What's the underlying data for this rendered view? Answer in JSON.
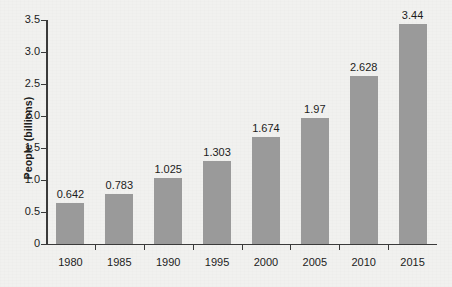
{
  "chart_data": {
    "type": "bar",
    "title": "",
    "xlabel": "",
    "ylabel": "People (billions)",
    "categories": [
      "1980",
      "1985",
      "1990",
      "1995",
      "2000",
      "2005",
      "2010",
      "2015"
    ],
    "values": [
      0.642,
      0.783,
      1.025,
      1.303,
      1.674,
      1.97,
      2.628,
      3.44
    ],
    "value_labels": [
      "0.642",
      "0.783",
      "1.025",
      "1.303",
      "1.674",
      "1.97",
      "2.628",
      "3.44"
    ],
    "ylim": [
      0,
      3.5
    ],
    "yticks": [
      0,
      0.5,
      1.0,
      1.5,
      2.0,
      2.5,
      3.0,
      3.5
    ],
    "ytick_labels": [
      "0",
      "0.5",
      "1.0",
      "1.5",
      "2.0",
      "2.5",
      "3.0",
      "3.5"
    ],
    "grid": false,
    "legend": null,
    "series": [
      {
        "name": "People (billions)",
        "values": [
          0.642,
          0.783,
          1.025,
          1.303,
          1.674,
          1.97,
          2.628,
          3.44
        ]
      }
    ],
    "colors": {
      "bar": "#9a9a9a",
      "background": "#f1f1ef",
      "axis": "#3a3a3a",
      "text": "#1c1c1c"
    }
  }
}
